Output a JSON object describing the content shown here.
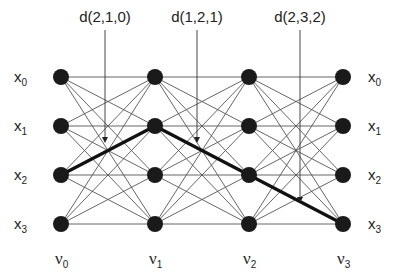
{
  "diagram": {
    "type": "trellis",
    "columns": [
      {
        "base": "ν",
        "sub": "0",
        "x": 61
      },
      {
        "base": "ν",
        "sub": "1",
        "x": 155
      },
      {
        "base": "ν",
        "sub": "2",
        "x": 249
      },
      {
        "base": "ν",
        "sub": "3",
        "x": 343
      }
    ],
    "rows": [
      {
        "base": "x",
        "sub": "0",
        "y": 77
      },
      {
        "base": "x",
        "sub": "1",
        "y": 126
      },
      {
        "base": "x",
        "sub": "2",
        "y": 175
      },
      {
        "base": "x",
        "sub": "3",
        "y": 224
      }
    ],
    "annotations": [
      {
        "label": "d(2,1,0)",
        "x": 105,
        "y_end": 142
      },
      {
        "label": "d(1,2,1)",
        "x": 197,
        "y_end": 142
      },
      {
        "label": "d(2,3,2)",
        "x": 300,
        "y_end": 202
      }
    ],
    "highlighted_path": [
      [
        0,
        2
      ],
      [
        1,
        1
      ],
      [
        2,
        2
      ],
      [
        3,
        3
      ]
    ],
    "colors": {
      "node": "#1a1a1a",
      "edge": "#555555",
      "path": "#111111"
    }
  }
}
